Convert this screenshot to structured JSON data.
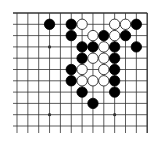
{
  "board": {
    "description": "Partial Go board diagram (top-right region)",
    "columns": 13,
    "rows": 11,
    "origin_x": 17,
    "origin_y": 13,
    "col_spacing": 10.85,
    "row_spacing": 11.3,
    "top_edge": true,
    "right_edge": true,
    "line_color": "#333333",
    "background": "#ffffff",
    "star_points": [
      [
        3,
        3
      ],
      [
        9,
        3
      ],
      [
        3,
        9
      ],
      [
        9,
        9
      ]
    ],
    "stones": [
      {
        "color": "black",
        "col": 3,
        "row": 1
      },
      {
        "color": "black",
        "col": 5,
        "row": 1
      },
      {
        "color": "white",
        "col": 6,
        "row": 1
      },
      {
        "color": "white",
        "col": 9,
        "row": 1
      },
      {
        "color": "white",
        "col": 10,
        "row": 1
      },
      {
        "color": "black",
        "col": 11,
        "row": 1
      },
      {
        "color": "black",
        "col": 5,
        "row": 2
      },
      {
        "color": "white",
        "col": 7,
        "row": 2
      },
      {
        "color": "black",
        "col": 8,
        "row": 2
      },
      {
        "color": "white",
        "col": 9,
        "row": 2
      },
      {
        "color": "black",
        "col": 10,
        "row": 2
      },
      {
        "color": "black",
        "col": 6,
        "row": 3
      },
      {
        "color": "black",
        "col": 7,
        "row": 3
      },
      {
        "color": "white",
        "col": 8,
        "row": 3
      },
      {
        "color": "black",
        "col": 9,
        "row": 3
      },
      {
        "color": "black",
        "col": 11,
        "row": 3
      },
      {
        "color": "black",
        "col": 6,
        "row": 4
      },
      {
        "color": "white",
        "col": 7,
        "row": 4
      },
      {
        "color": "white",
        "col": 8,
        "row": 4
      },
      {
        "color": "black",
        "col": 9,
        "row": 4
      },
      {
        "color": "black",
        "col": 5,
        "row": 5
      },
      {
        "color": "white",
        "col": 6,
        "row": 5
      },
      {
        "color": "white",
        "col": 8,
        "row": 5
      },
      {
        "color": "black",
        "col": 9,
        "row": 5
      },
      {
        "color": "black",
        "col": 5,
        "row": 6
      },
      {
        "color": "white",
        "col": 6,
        "row": 6
      },
      {
        "color": "white",
        "col": 7,
        "row": 6
      },
      {
        "color": "white",
        "col": 8,
        "row": 6
      },
      {
        "color": "black",
        "col": 9,
        "row": 6
      },
      {
        "color": "black",
        "col": 6,
        "row": 7
      },
      {
        "color": "black",
        "col": 9,
        "row": 7
      },
      {
        "color": "black",
        "col": 7,
        "row": 8
      }
    ]
  }
}
